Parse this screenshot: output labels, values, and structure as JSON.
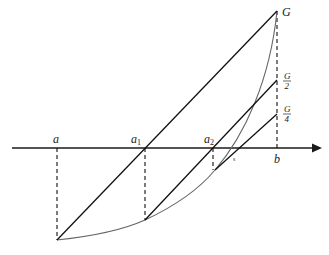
{
  "diagram": {
    "type": "geometric-construction",
    "axis": {
      "y": 148,
      "x_start": 12,
      "x_end": 322,
      "color": "#1a1a1a"
    },
    "points": {
      "a": {
        "label": "a",
        "sub": "",
        "x": 57,
        "y": 148,
        "bottom_y": 240
      },
      "a1": {
        "label": "a",
        "sub": "1",
        "x": 145,
        "y": 148,
        "bottom_y": 220
      },
      "a2": {
        "label": "a",
        "sub": "2",
        "x": 213,
        "y": 148,
        "bottom_y": 170
      },
      "b": {
        "label": "b",
        "sub": "",
        "x": 277,
        "y": 148
      }
    },
    "right_labels": {
      "G": {
        "text": "G",
        "y": 11
      },
      "G2": {
        "num": "G",
        "den": "2",
        "y": 80
      },
      "G4": {
        "num": "G",
        "den": "4",
        "y": 114
      }
    },
    "small_label": {
      "text": "s",
      "x": 235,
      "y": 160
    },
    "colors": {
      "line": "#111111",
      "curve": "#666666",
      "dash": "#111111"
    }
  }
}
